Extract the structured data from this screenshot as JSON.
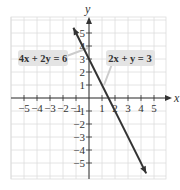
{
  "chart_data": {
    "type": "line",
    "title": "",
    "xlabel": "x",
    "ylabel": "y",
    "xlim": [
      -5.5,
      6
    ],
    "ylim": [
      -6,
      6
    ],
    "grid": true,
    "x_ticks": [
      -5,
      -4,
      -3,
      -2,
      -1,
      1,
      2,
      3,
      4,
      5
    ],
    "y_ticks": [
      5,
      4,
      3,
      2,
      1,
      -1,
      -2,
      -3,
      -4,
      -5
    ],
    "x_tick_labels": [
      "−5",
      "−4",
      "−3",
      "−2",
      "−1",
      "1",
      "2",
      "3",
      "4",
      "5"
    ],
    "y_tick_labels": [
      "5",
      "4",
      "3",
      "2",
      "1",
      "−1",
      "−2",
      "−3",
      "−4",
      "−5"
    ],
    "series": [
      {
        "name": "2x + y = 3 (also 4x + 2y = 6)",
        "equation": "y = -2x + 3",
        "x": [
          -1.2,
          0,
          1.5,
          2,
          4.4
        ],
        "y": [
          5.4,
          3,
          0,
          -1,
          -5.8
        ],
        "color": "#333333"
      }
    ],
    "annotations": [
      {
        "text": "4x + 2y = 6",
        "points_to": [
          0,
          4
        ]
      },
      {
        "text": "2x + y = 3",
        "points_to": [
          1,
          1
        ]
      }
    ]
  },
  "labels": {
    "x_axis": "x",
    "y_axis": "y",
    "callout_left": "4x + 2y = 6",
    "callout_right": "2x + y = 3"
  },
  "colors": {
    "grid": "#dddddd",
    "axis": "#333333",
    "line": "#333333",
    "callout_bg": "#e4e4e4"
  }
}
